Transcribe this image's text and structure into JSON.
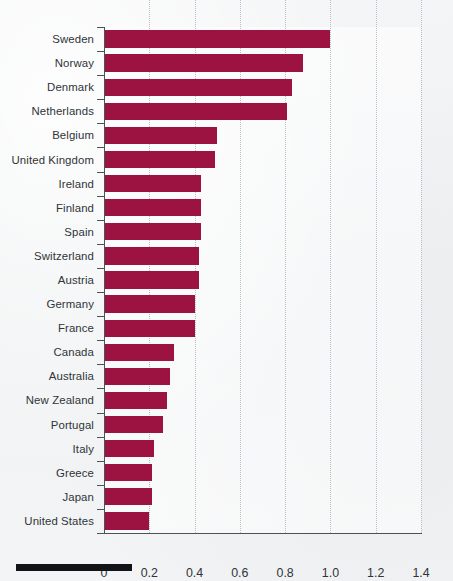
{
  "figure": {
    "background_color": "#f2f3f4",
    "bar_color": "#9c1240",
    "label_color": "#2f3438",
    "gridline_color": "#b9bfc6"
  },
  "chart_data": {
    "type": "bar",
    "orientation": "horizontal",
    "title": "",
    "subtitle": "",
    "xlabel": "",
    "ylabel": "",
    "xlim": [
      0,
      1.4
    ],
    "grid": true,
    "legend": null,
    "xticks": [
      "0",
      "0.2",
      "0.4",
      "0.6",
      "0.8",
      "1.0",
      "1.2",
      "1.4"
    ],
    "xtick_values": [
      0,
      0.2,
      0.4,
      0.6,
      0.8,
      1.0,
      1.2,
      1.4
    ],
    "categories": [
      "Sweden",
      "Norway",
      "Denmark",
      "Netherlands",
      "Belgium",
      "United Kingdom",
      "Ireland",
      "Finland",
      "Spain",
      "Switzerland",
      "Austria",
      "Germany",
      "France",
      "Canada",
      "Australia",
      "New Zealand",
      "Portugal",
      "Italy",
      "Greece",
      "Japan",
      "United States"
    ],
    "values": [
      1.0,
      0.88,
      0.83,
      0.81,
      0.5,
      0.49,
      0.43,
      0.43,
      0.43,
      0.42,
      0.42,
      0.4,
      0.4,
      0.31,
      0.29,
      0.28,
      0.26,
      0.22,
      0.21,
      0.21,
      0.2
    ]
  }
}
